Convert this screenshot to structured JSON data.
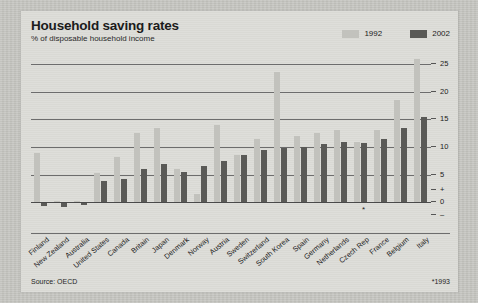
{
  "header": {
    "title": "Household saving rates",
    "subtitle": "% of disposable household income"
  },
  "legend": [
    {
      "label": "1992",
      "color": "#c2c2bd"
    },
    {
      "label": "2002",
      "color": "#5a5a57"
    }
  ],
  "footer": {
    "source": "Source: OECD",
    "footnote": "*1993"
  },
  "axis": {
    "tick_labels": [
      "25",
      "20",
      "15",
      "10",
      "5",
      "+",
      "0",
      "–"
    ],
    "tick_values": [
      25,
      20,
      15,
      10,
      5,
      null,
      0,
      null
    ]
  },
  "chart_data": {
    "type": "bar",
    "title": "Household saving rates",
    "subtitle": "% of disposable household income",
    "xlabel": "",
    "ylabel": "% of disposable household income",
    "ylim": [
      -3,
      27
    ],
    "yticks": [
      0,
      5,
      10,
      15,
      20,
      25
    ],
    "grid": true,
    "legend_position": "top-right",
    "source": "Source: OECD",
    "footnote": "*1993",
    "categories": [
      "Finland",
      "New Zealand",
      "Australia",
      "United States",
      "Canada",
      "Britain",
      "Japan",
      "Denmark",
      "Norway",
      "Austria",
      "Sweden",
      "Switzerland",
      "South Korea",
      "Spain",
      "Germany",
      "Netherlands",
      "Czech Rep",
      "France",
      "Belgium",
      "Italy"
    ],
    "series": [
      {
        "name": "1992",
        "color": "#c2c2bd",
        "values": [
          9.0,
          0.3,
          0.3,
          5.3,
          8.2,
          12.5,
          13.5,
          6.0,
          1.5,
          14.0,
          8.5,
          11.5,
          23.5,
          12.0,
          12.5,
          13.0,
          11.0,
          13.0,
          18.5,
          26.0
        ]
      },
      {
        "name": "2002",
        "color": "#5a5a57",
        "values": [
          -0.7,
          -0.8,
          -0.4,
          3.8,
          4.2,
          6.0,
          7.0,
          5.5,
          6.5,
          7.5,
          8.5,
          9.5,
          9.8,
          10.0,
          10.5,
          11.0,
          10.8,
          11.5,
          13.5,
          15.5
        ]
      }
    ],
    "annotations": [
      {
        "text": "*",
        "category": "Czech Rep",
        "series": "2002",
        "note": "1993 data"
      }
    ]
  }
}
